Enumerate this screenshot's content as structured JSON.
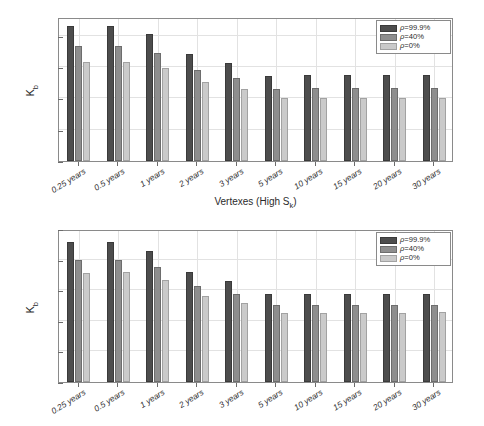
{
  "chart_data": [
    {
      "id": "top",
      "type": "bar",
      "title": "",
      "xlabel": "Vertexes (High Sₖ)",
      "xlabel_base": "Vertexes (High S",
      "xlabel_sub": "k",
      "xlabel_tail": ")",
      "ylabel": "Kᵇ",
      "ylabel_base": "K",
      "ylabel_sub": "b",
      "ylim": [
        0,
        0.23
      ],
      "yticks": [
        0,
        0.05,
        0.1,
        0.15,
        0.2
      ],
      "ytick_labels": [
        "0",
        "0.05",
        "0.1",
        "0.15",
        "0.2"
      ],
      "grid": true,
      "legend_position": "top-right",
      "categories": [
        "0.25 years",
        "0.5 years",
        "1 years",
        "2 years",
        "3 years",
        "5 years",
        "10 years",
        "15 years",
        "20 years",
        "30 years"
      ],
      "series": [
        {
          "name": "ρ=99.9%",
          "color": "#4d4d4d",
          "values": [
            0.2155,
            0.2155,
            0.2032,
            0.1702,
            0.156,
            0.1363,
            0.1366,
            0.1366,
            0.1368,
            0.1368
          ]
        },
        {
          "name": "ρ=40%",
          "color": "#8e8e8e",
          "values": [
            0.1832,
            0.1832,
            0.1722,
            0.1452,
            0.1332,
            0.1158,
            0.116,
            0.1162,
            0.1165,
            0.1165
          ]
        },
        {
          "name": "ρ=0%",
          "color": "#cacaca",
          "values": [
            0.158,
            0.158,
            0.1487,
            0.1255,
            0.1155,
            0.1005,
            0.1008,
            0.1008,
            0.101,
            0.101
          ]
        }
      ]
    },
    {
      "id": "bottom",
      "type": "bar",
      "title": "",
      "xlabel": "",
      "ylabel": "Kᵇ",
      "ylabel_base": "K",
      "ylabel_sub": "b",
      "ylim": [
        0,
        0.1
      ],
      "yticks": [
        0,
        0.02,
        0.04,
        0.06,
        0.08,
        0.1
      ],
      "ytick_labels": [
        "0",
        "0.02",
        "0.04",
        "0.06",
        "0.08",
        "0.1"
      ],
      "grid": true,
      "legend_position": "top-right",
      "categories": [
        "0.25 years",
        "0.5 years",
        "1 years",
        "2 years",
        "3 years",
        "5 years",
        "10 years",
        "15 years",
        "20 years",
        "30 years"
      ],
      "series": [
        {
          "name": "ρ=99.9%",
          "color": "#4d4d4d",
          "values": [
            0.0915,
            0.0915,
            0.0858,
            0.0718,
            0.0658,
            0.0574,
            0.0575,
            0.0575,
            0.0576,
            0.0576
          ]
        },
        {
          "name": "ρ=40%",
          "color": "#8e8e8e",
          "values": [
            0.0798,
            0.08,
            0.075,
            0.0628,
            0.0578,
            0.0502,
            0.0503,
            0.0503,
            0.0504,
            0.0504
          ]
        },
        {
          "name": "ρ=0%",
          "color": "#cacaca",
          "values": [
            0.0715,
            0.0718,
            0.067,
            0.0562,
            0.0518,
            0.045,
            0.0451,
            0.0452,
            0.0452,
            0.0455
          ]
        }
      ]
    }
  ],
  "legend": {
    "entries": [
      {
        "label_prefix": "ρ",
        "label_suffix": "=99.9%",
        "series": 0
      },
      {
        "label_prefix": "ρ",
        "label_suffix": "=40%",
        "series": 1
      },
      {
        "label_prefix": "ρ",
        "label_suffix": "=0%",
        "series": 2
      }
    ]
  },
  "colors": {
    "series_dark": "#4d4d4d",
    "series_mid": "#8e8e8e",
    "series_light": "#cacaca",
    "axis": "#8a8a8a",
    "grid": "#e2e2e2",
    "text": "#2b2b2b",
    "background": "#ffffff"
  }
}
